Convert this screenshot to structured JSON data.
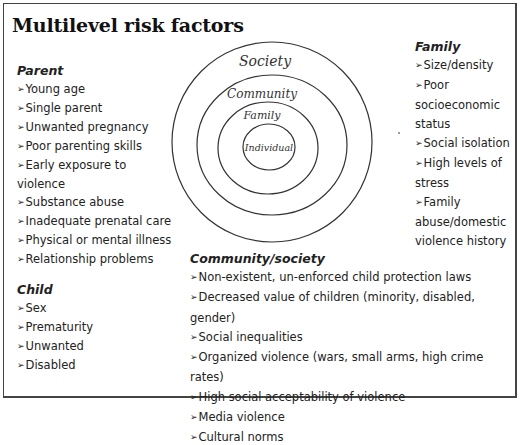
{
  "title": "Multilevel risk factors",
  "bullet_glyph": "➢",
  "diagram": {
    "type": "concentric-circles",
    "rings": [
      {
        "label": "Society",
        "cx": 272,
        "cy": 142,
        "rx": 100,
        "ry": 100
      },
      {
        "label": "Community",
        "cx": 272,
        "cy": 145,
        "rx": 75,
        "ry": 70
      },
      {
        "label": "Family",
        "cx": 268,
        "cy": 148,
        "rx": 50,
        "ry": 46
      },
      {
        "label": "Individual",
        "cx": 269,
        "cy": 147,
        "rx": 26,
        "ry": 23
      }
    ],
    "stroke_color": "#333333"
  },
  "parent": {
    "heading": "Parent",
    "items": [
      "Young age",
      "Single parent",
      "Unwanted pregnancy",
      "Poor parenting skills",
      "Early exposure to violence",
      "Substance abuse",
      "Inadequate prenatal care",
      "Physical or mental illness",
      "Relationship problems"
    ]
  },
  "child": {
    "heading": "Child",
    "items": [
      "Sex",
      "Prematurity",
      "Unwanted",
      "Disabled"
    ]
  },
  "family": {
    "heading": "Family",
    "items": [
      "Size/density",
      "Poor socioeconomic status",
      "Social isolation",
      "High levels of stress",
      "Family abuse/domestic violence history"
    ]
  },
  "community": {
    "heading": "Community/society",
    "items": [
      "Non-existent, un-enforced child protection laws",
      "Decreased value of children (minority, disabled, gender)",
      "Social inequalities",
      "Organized violence (wars, small arms, high crime rates)",
      "High social acceptability of violence",
      "Media violence",
      "Cultural norms"
    ]
  }
}
